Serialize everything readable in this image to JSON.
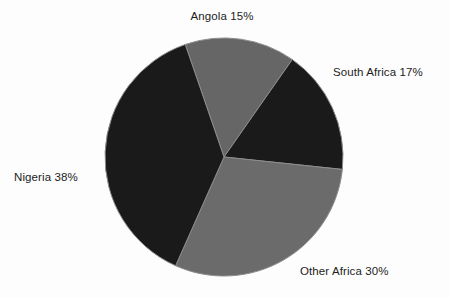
{
  "chart_data": {
    "type": "pie",
    "title": "",
    "subtitle": "",
    "xlabel": "",
    "ylabel": "",
    "legend_position": "none",
    "grid": false,
    "labels_position": "outside",
    "categories": [
      "Angola",
      "South Africa",
      "Other Africa",
      "Nigeria"
    ],
    "values": [
      15,
      17,
      30,
      38
    ],
    "unit": "%",
    "slices": [
      {
        "name": "Angola",
        "value": 15,
        "label": "Angola 15%",
        "color": "#666666",
        "start_angle": -19,
        "sweep_angle": 54
      },
      {
        "name": "South Africa",
        "value": 17,
        "label": "South Africa 17%",
        "color": "#1a1a1a",
        "start_angle": 35,
        "sweep_angle": 61
      },
      {
        "name": "Other Africa",
        "value": 30,
        "label": "Other Africa 30%",
        "color": "#6b6b6b",
        "start_angle": 96,
        "sweep_angle": 108
      },
      {
        "name": "Nigeria",
        "value": 38,
        "label": "Nigeria 38%",
        "color": "#1a1a1a",
        "start_angle": 204,
        "sweep_angle": 137
      }
    ]
  },
  "labels": {
    "angola": "Angola 15%",
    "south_africa": "South Africa 17%",
    "other_africa": "Other Africa 30%",
    "nigeria": "Nigeria 38%"
  },
  "colors": {
    "background": "#fdfdfd",
    "dark_slice": "#1a1a1a",
    "gray_slice": "#686868",
    "slice_divider": "#8d8d8d",
    "label_text": "#1c1c1c"
  },
  "geometry": {
    "center_x": 224,
    "center_y": 157,
    "radius": 119
  }
}
